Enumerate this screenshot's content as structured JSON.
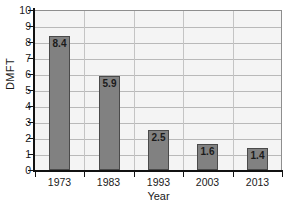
{
  "chart_data": {
    "type": "bar",
    "title": "",
    "categories": [
      "1973",
      "1983",
      "1993",
      "2003",
      "2013"
    ],
    "values": [
      8.4,
      5.9,
      2.5,
      1.6,
      1.4
    ],
    "value_labels": [
      "8.4",
      "5.9",
      "2.5",
      "1.6",
      "1.4"
    ],
    "xlabel": "Year",
    "ylabel": "DMFT",
    "ylim": [
      0,
      10
    ],
    "ytick_labels": [
      "0",
      "1",
      "2",
      "3",
      "4",
      "5",
      "6",
      "7",
      "8",
      "9",
      "10"
    ],
    "ytick_values": [
      0,
      1,
      2,
      3,
      4,
      5,
      6,
      7,
      8,
      9,
      10
    ],
    "grid": "horizontal-and-vertical",
    "legend": "none",
    "colors": {
      "bar_fill": "#818181",
      "bar_border": "#4a4a4a",
      "plot_background": "#f4f4f4",
      "gridline": "#b9b9b9",
      "axis": "#111111",
      "text": "#1a1a1a"
    }
  }
}
